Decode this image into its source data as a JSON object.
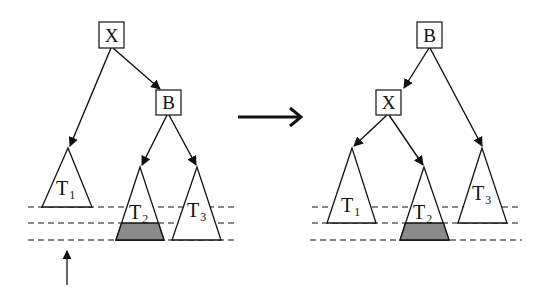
{
  "diagram": {
    "type": "tree-rotation",
    "colors": {
      "stroke": "#111111",
      "shade": "#8a8a8a",
      "background": "#ffffff"
    },
    "before": {
      "nodes": [
        {
          "id": "X",
          "label": "X"
        },
        {
          "id": "B",
          "label": "B"
        }
      ],
      "subtrees": [
        {
          "id": "T1",
          "label": "T",
          "sub": "1"
        },
        {
          "id": "T2",
          "label": "T",
          "sub": "2",
          "shaded_bottom": true
        },
        {
          "id": "T3",
          "label": "T",
          "sub": "3"
        }
      ],
      "edges": [
        [
          "X",
          "T1"
        ],
        [
          "X",
          "B"
        ],
        [
          "B",
          "T2"
        ],
        [
          "B",
          "T3"
        ]
      ]
    },
    "after": {
      "nodes": [
        {
          "id": "B",
          "label": "B"
        },
        {
          "id": "X",
          "label": "X"
        }
      ],
      "subtrees": [
        {
          "id": "T1",
          "label": "T",
          "sub": "1"
        },
        {
          "id": "T2",
          "label": "T",
          "sub": "2",
          "shaded_bottom": true
        },
        {
          "id": "T3",
          "label": "T",
          "sub": "3"
        }
      ],
      "edges": [
        [
          "B",
          "X"
        ],
        [
          "B",
          "T3"
        ],
        [
          "X",
          "T1"
        ],
        [
          "X",
          "T2"
        ]
      ]
    },
    "transition_arrow": "rotation-arrow",
    "level_lines": 3,
    "marker": "up-arrow-indicating-level"
  }
}
